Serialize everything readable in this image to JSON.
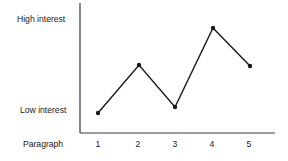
{
  "chart_data": {
    "type": "line",
    "title": "",
    "xlabel": "Paragraph",
    "ylabel": "",
    "categories": [
      "1",
      "2",
      "3",
      "4",
      "5"
    ],
    "x": [
      1,
      2,
      3,
      4,
      5
    ],
    "values": [
      0.18,
      0.62,
      0.24,
      0.97,
      0.61
    ],
    "y_scale_labels": {
      "high": "High interest",
      "low": "Low interest"
    },
    "ylim": [
      0,
      1
    ],
    "grid": false,
    "legend": null,
    "markers": true,
    "line_color": "#1a1a1a"
  },
  "axis": {
    "y_high_label": "High interest",
    "y_low_label": "Low interest",
    "x_label": "Paragraph",
    "ticks": [
      "1",
      "2",
      "3",
      "4",
      "5"
    ]
  },
  "plot_points": [
    {
      "x": 98,
      "y": 113
    },
    {
      "x": 139,
      "y": 65
    },
    {
      "x": 175,
      "y": 107
    },
    {
      "x": 213,
      "y": 28
    },
    {
      "x": 250,
      "y": 66
    }
  ]
}
